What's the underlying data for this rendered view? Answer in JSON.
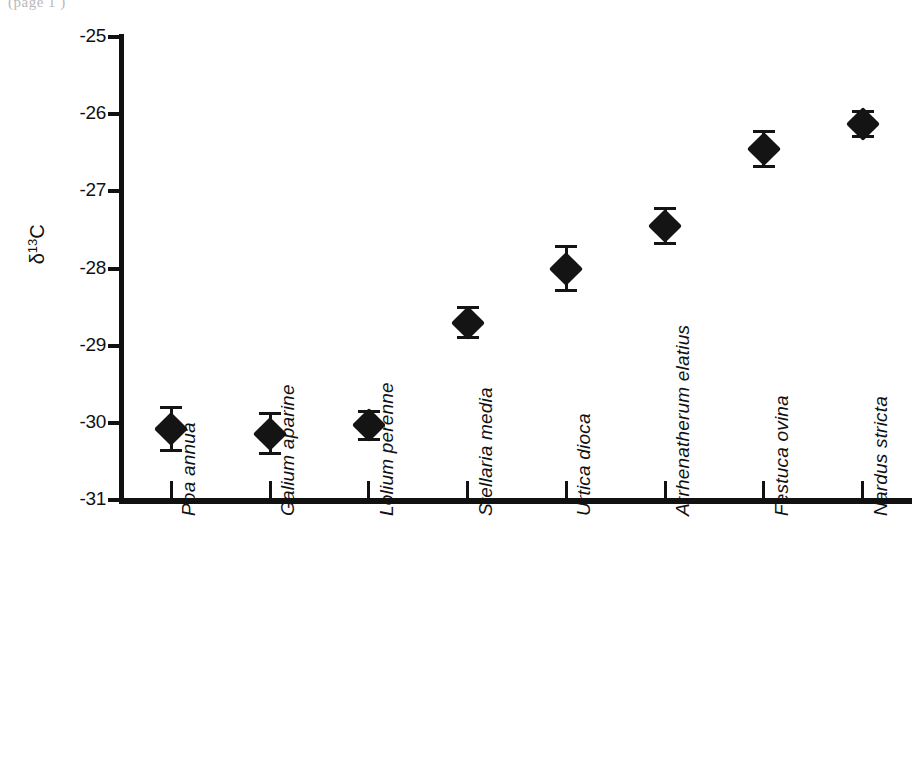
{
  "figure": {
    "scan_fragment": "(page    1   )",
    "background_color": "#ffffff",
    "ink_color": "#141414"
  },
  "chart_data": {
    "type": "scatter",
    "title": "",
    "subtitle": "",
    "xlabel": "",
    "ylabel": "δ13C",
    "ylabel_parts": {
      "delta": "δ",
      "superscript": "13",
      "element": "C"
    },
    "ylim": [
      -31,
      -25
    ],
    "ytick_labels": [
      "-25",
      "-26",
      "-27",
      "-28",
      "-29",
      "-30",
      "-31"
    ],
    "ytick_values": [
      -25,
      -26,
      -27,
      -28,
      -29,
      -30,
      -31
    ],
    "grid": false,
    "legend": false,
    "legend_position": "none",
    "error_bar_type": "symmetric",
    "marker": "filled-diamond",
    "categories": [
      "Poa annua",
      "Galium aparine",
      "Lolium perenne",
      "Stellaria media",
      "Urtica dioca",
      "Arrhenatherum elatius",
      "Festuca ovina",
      "Nardus stricta"
    ],
    "values": [
      -30.08,
      -30.14,
      -30.03,
      -28.7,
      -28.0,
      -27.45,
      -26.45,
      -26.13
    ],
    "errors": [
      0.3,
      0.28,
      0.2,
      0.22,
      0.3,
      0.25,
      0.25,
      0.18
    ],
    "points": [
      {
        "category": "Poa annua",
        "value": -30.08,
        "error": 0.3,
        "lower": -30.38,
        "upper": -29.78
      },
      {
        "category": "Galium aparine",
        "value": -30.14,
        "error": 0.28,
        "lower": -30.42,
        "upper": -29.86
      },
      {
        "category": "Lolium perenne",
        "value": -30.03,
        "error": 0.2,
        "lower": -30.23,
        "upper": -29.83
      },
      {
        "category": "Stellaria media",
        "value": -28.7,
        "error": 0.22,
        "lower": -28.92,
        "upper": -28.48
      },
      {
        "category": "Urtica dioca",
        "value": -28.0,
        "error": 0.3,
        "lower": -28.3,
        "upper": -27.7
      },
      {
        "category": "Arrhenatherum elatius",
        "value": -27.45,
        "error": 0.25,
        "lower": -27.7,
        "upper": -27.2
      },
      {
        "category": "Festuca ovina",
        "value": -26.45,
        "error": 0.25,
        "lower": -26.7,
        "upper": -26.2
      },
      {
        "category": "Nardus stricta",
        "value": -26.13,
        "error": 0.18,
        "lower": -26.31,
        "upper": -25.95
      }
    ]
  }
}
